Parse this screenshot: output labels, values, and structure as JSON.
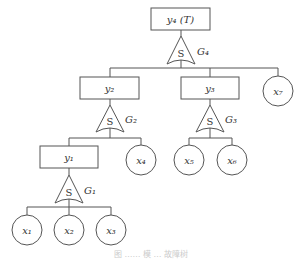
{
  "diagram": {
    "type": "fault-tree",
    "nodes": {
      "top": {
        "label": "y₄ (T)"
      },
      "y2": {
        "label": "y₂"
      },
      "y3": {
        "label": "y₃"
      },
      "y1": {
        "label": "y₁"
      },
      "x1": {
        "label": "x₁"
      },
      "x2": {
        "label": "x₂"
      },
      "x3": {
        "label": "x₃"
      },
      "x4": {
        "label": "x₄"
      },
      "x5": {
        "label": "x₅"
      },
      "x6": {
        "label": "x₆"
      },
      "x7": {
        "label": "x₇"
      }
    },
    "gates": {
      "g4": {
        "symbol": "S",
        "label": "G₄"
      },
      "g2": {
        "symbol": "S",
        "label": "G₂"
      },
      "g3": {
        "symbol": "S",
        "label": "G₃"
      },
      "g1": {
        "symbol": "S",
        "label": "G₁"
      }
    },
    "caption": "图 …… 模 … 故障树"
  }
}
